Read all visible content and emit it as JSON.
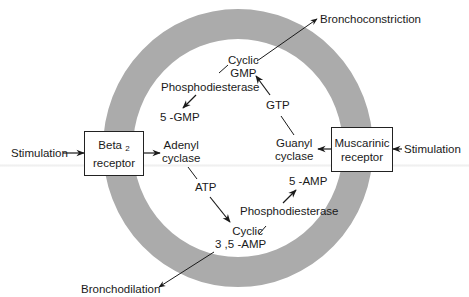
{
  "diagram": {
    "ring_color": "#ababab",
    "line_color": "#1a1a1a",
    "left_receptor": {
      "name_main": "Beta",
      "name_sub": "2",
      "name_line2": "receptor"
    },
    "right_receptor": {
      "line1": "Muscarinic",
      "line2": "receptor"
    },
    "stimulation_left": "Stimulation",
    "stimulation_right": "Stimulation",
    "adenyl_cyclase": {
      "line1": "Adenyl",
      "line2": "cyclase"
    },
    "atp": "ATP",
    "cyclic_amp": {
      "line1": "Cyclic",
      "line2": "3 ,5 -AMP"
    },
    "phosphodiesterase_amp": "Phosphodiesterase",
    "five_amp": "5 -AMP",
    "bronchodilation": "Bronchodilation",
    "guanyl_cyclase": {
      "line1": "Guanyl",
      "line2": "cyclase"
    },
    "gtp": "GTP",
    "cyclic_gmp": {
      "line1": "Cyclic",
      "line2": "GMP"
    },
    "phosphodiesterase_gmp": "Phosphodiesterase",
    "five_gmp": "5 -GMP",
    "bronchoconstriction": "Bronchoconstriction"
  }
}
